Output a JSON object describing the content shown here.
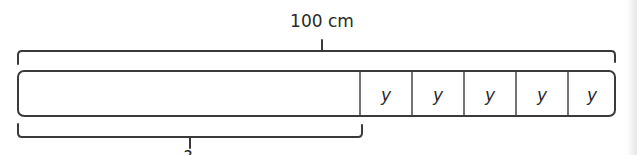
{
  "diagram": {
    "type": "bar-model",
    "total_label": "100 cm",
    "unknown_label": "?",
    "segments": [
      {
        "label": "",
        "role": "unknown-part"
      },
      {
        "label": "y"
      },
      {
        "label": "y"
      },
      {
        "label": "y"
      },
      {
        "label": "y"
      },
      {
        "label": "y"
      }
    ],
    "colors": {
      "stroke": "#3a3a3a",
      "text": "#2a2a2a",
      "fill": "#ffffff"
    }
  }
}
